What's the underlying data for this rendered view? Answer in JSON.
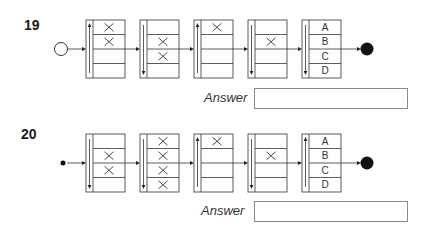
{
  "questions": [
    {
      "number": "19",
      "start_node": "hollow-circle",
      "end_node": "filled-circle",
      "boxes": [
        {
          "arrow": "up",
          "cells": [
            "X",
            "X",
            "",
            ""
          ]
        },
        {
          "arrow": "down",
          "cells": [
            "",
            "X",
            "X",
            ""
          ]
        },
        {
          "arrow": "up",
          "cells": [
            "X",
            "",
            "",
            ""
          ]
        },
        {
          "arrow": "down",
          "cells": [
            "",
            "X",
            "",
            ""
          ]
        },
        {
          "arrow": "down",
          "cells": [
            "A",
            "B",
            "C",
            "D"
          ]
        }
      ],
      "answer_label": "Answer",
      "answer_value": ""
    },
    {
      "number": "20",
      "start_node": "small-dot",
      "end_node": "filled-circle",
      "boxes": [
        {
          "arrow": "down",
          "cells": [
            "",
            "X",
            "X",
            ""
          ]
        },
        {
          "arrow": "down",
          "cells": [
            "X",
            "X",
            "X",
            "X"
          ]
        },
        {
          "arrow": "up",
          "cells": [
            "X",
            "",
            "",
            ""
          ]
        },
        {
          "arrow": "down",
          "cells": [
            "",
            "X",
            "",
            ""
          ]
        },
        {
          "arrow": "up",
          "cells": [
            "A",
            "B",
            "C",
            "D"
          ]
        }
      ],
      "answer_label": "Answer",
      "answer_value": ""
    }
  ]
}
